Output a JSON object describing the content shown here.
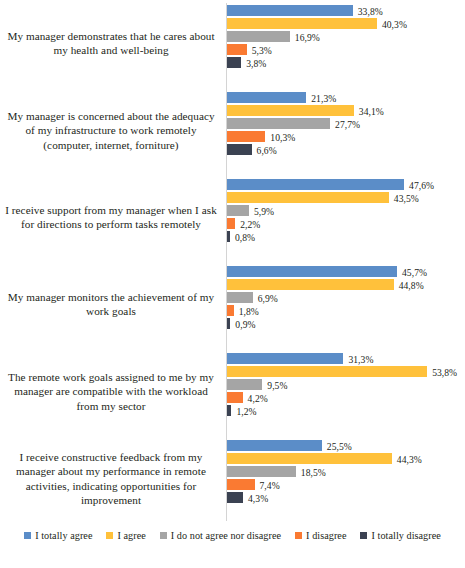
{
  "chart_data": {
    "type": "bar",
    "orientation": "horizontal",
    "title": "",
    "subtitle": "",
    "xlabel": "",
    "ylabel": "",
    "grid": false,
    "legend_position": "bottom",
    "value_suffix": "%",
    "decimal_separator": ",",
    "xlim": [
      0,
      60
    ],
    "categories": [
      "My manager demonstrates that he cares about my health and well-being",
      "My manager is concerned about the adequacy of my infrastructure to work remotely (computer, internet, forniture)",
      "I receive support from my manager when I ask for directions to perform tasks remotely",
      "My manager monitors the achievement of my work goals",
      "The remote work goals assigned to me by my manager are compatible with the workload from my sector",
      "I receive constructive feedback from my manager about my performance in remote activities, indicating opportunities for improvement"
    ],
    "series": [
      {
        "name": "I totally agree",
        "color": "#5B8DC8",
        "values": [
          33.8,
          21.3,
          47.6,
          45.7,
          31.3,
          25.5
        ],
        "labels": [
          "33,8%",
          "21,3%",
          "47,6%",
          "45,7%",
          "31,3%",
          "25,5%"
        ]
      },
      {
        "name": "I agree",
        "color": "#FFC13B",
        "values": [
          40.3,
          34.1,
          43.5,
          44.8,
          53.8,
          44.3
        ],
        "labels": [
          "40,3%",
          "34,1%",
          "43,5%",
          "44,8%",
          "53,8%",
          "44,3%"
        ]
      },
      {
        "name": "I do not agree nor disagree",
        "color": "#A5A5A5",
        "values": [
          16.9,
          27.7,
          5.9,
          6.9,
          9.5,
          18.5
        ],
        "labels": [
          "16,9%",
          "27,7%",
          "5,9%",
          "6,9%",
          "9,5%",
          "18,5%"
        ]
      },
      {
        "name": "I disagree",
        "color": "#FA7A32",
        "values": [
          5.3,
          10.3,
          2.2,
          1.8,
          4.2,
          7.4
        ],
        "labels": [
          "5,3%",
          "10,3%",
          "2,2%",
          "1,8%",
          "4,2%",
          "7,4%"
        ]
      },
      {
        "name": "I totally disagree",
        "color": "#3B4252",
        "values": [
          3.8,
          6.6,
          0.8,
          0.9,
          1.2,
          4.3
        ],
        "labels": [
          "3,8%",
          "6,6%",
          "0,8%",
          "0,9%",
          "1,2%",
          "4,3%"
        ]
      }
    ]
  },
  "legend": {
    "items": [
      {
        "label": "I totally agree",
        "color": "#5B8DC8"
      },
      {
        "label": "I agree",
        "color": "#FFC13B"
      },
      {
        "label": "I do not agree nor disagree",
        "color": "#A5A5A5"
      },
      {
        "label": "I disagree",
        "color": "#FA7A32"
      },
      {
        "label": "I totally disagree",
        "color": "#3B4252"
      }
    ]
  }
}
